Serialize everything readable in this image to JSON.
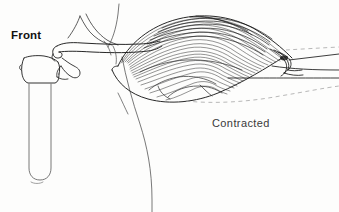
{
  "illustration": {
    "title": "Front view of contracted biceps muscle",
    "view_label": "Front",
    "state_label": "Contracted",
    "background_color": "#fdfdfc",
    "ink_color": "#1b1b1b",
    "fiber_color": "#2a2a2a",
    "dashed_color": "#9a9a9a",
    "labels": [
      {
        "name": "front",
        "text": "Front",
        "x": 11,
        "y": 29,
        "bold": true
      },
      {
        "name": "contracted",
        "text": "Contracted",
        "x": 212,
        "y": 117,
        "bold": false
      }
    ],
    "parts": [
      {
        "name": "sternum-rib-bone",
        "description": "vertical bone at left with rounded lower end"
      },
      {
        "name": "clavicle",
        "description": "long slender bone running diagonally to the right"
      },
      {
        "name": "scapula-blade",
        "description": "thin curved blade above the clavicle"
      },
      {
        "name": "torso-outline",
        "description": "long curved body contour sweeping down"
      },
      {
        "name": "biceps-muscle-belly",
        "description": "bulging striated muscle, contracted"
      },
      {
        "name": "muscle-striations",
        "description": "dense parallel fiber lines across the belly"
      },
      {
        "name": "tendon-insertion",
        "description": "dark convergence point at the right of the belly"
      },
      {
        "name": "forearm-bones",
        "description": "two parallel lines extending right"
      },
      {
        "name": "relaxed-outline-dashed",
        "description": "dashed contour of the relaxed muscle position"
      }
    ]
  }
}
